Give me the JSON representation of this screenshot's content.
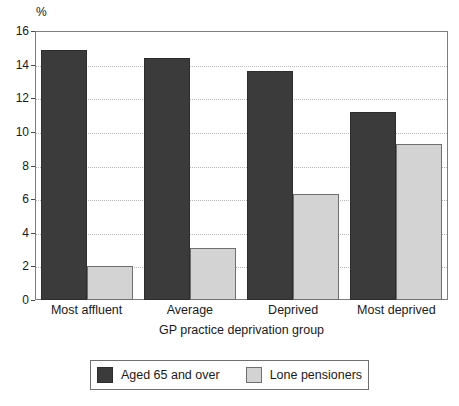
{
  "chart_data": {
    "type": "bar",
    "title": "",
    "subtitle": "",
    "unit_label": "%",
    "xlabel": "GP practice deprivation group",
    "ylabel": "%",
    "categories": [
      "Most affluent",
      "Average",
      "Deprived",
      "Most deprived"
    ],
    "series": [
      {
        "name": "Aged 65 and over",
        "color": "#3b3b3b",
        "values": [
          14.85,
          14.4,
          13.6,
          11.2
        ]
      },
      {
        "name": "Lone pensioners",
        "color": "#d3d3d3",
        "values": [
          2.0,
          3.1,
          6.3,
          9.25
        ]
      }
    ],
    "ylim": [
      0,
      16
    ],
    "yticks": [
      0,
      2,
      4,
      6,
      8,
      10,
      12,
      14,
      16
    ],
    "ytick_labels": [
      "0",
      "2",
      "4",
      "6",
      "8",
      "10",
      "12",
      "14",
      "16"
    ],
    "grid": true,
    "grid_axis": "y",
    "legend_position": "bottom"
  },
  "colors": {
    "series_dark": "#3b3b3b",
    "series_light": "#d3d3d3",
    "frame": "#7d7d7d",
    "gridline": "#b8b8b8",
    "text": "#1a1a1a",
    "background": "#ffffff"
  }
}
